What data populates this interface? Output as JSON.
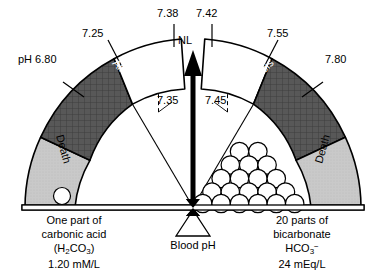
{
  "diagram": {
    "gauge": {
      "pointer_label": "NL",
      "segments": [
        {
          "name": "death-left",
          "label": "Death",
          "fill": "#c9c9c9",
          "from_ph": "6.80",
          "to_ph": "7.25"
        },
        {
          "name": "alkalosis-left",
          "label": "Alkalosis",
          "fill": "#5a5a5a",
          "from_ph": "7.25",
          "to_ph": "7.38"
        },
        {
          "name": "normal-left",
          "label": "",
          "fill": "#ffffff",
          "from_ph": "7.35",
          "to_ph": "7.38"
        },
        {
          "name": "normal-right",
          "label": "",
          "fill": "#ffffff",
          "from_ph": "7.42",
          "to_ph": "7.45"
        },
        {
          "name": "alkalosis-right",
          "label": "Alkalosis",
          "fill": "#5a5a5a",
          "from_ph": "7.42",
          "to_ph": "7.55"
        },
        {
          "name": "death-right",
          "label": "Death",
          "fill": "#c9c9c9",
          "from_ph": "7.55",
          "to_ph": "7.80"
        }
      ],
      "ticks": [
        {
          "name": "ph-6-80",
          "text": "pH 6.80",
          "solid": true
        },
        {
          "name": "ph-7-25",
          "text": "7.25",
          "solid": true
        },
        {
          "name": "ph-7-38",
          "text": "7.38",
          "solid": true
        },
        {
          "name": "ph-7-35",
          "text": "7.35",
          "solid": false
        },
        {
          "name": "ph-7-42",
          "text": "7.42",
          "solid": true
        },
        {
          "name": "ph-7-45",
          "text": "7.45",
          "solid": false
        },
        {
          "name": "ph-7-55",
          "text": "7.55",
          "solid": true
        },
        {
          "name": "ph-7-80",
          "text": "7.80",
          "solid": true
        }
      ]
    },
    "balance": {
      "fulcrum_label": "Blood pH",
      "left_pan": {
        "weight_count": 1,
        "lines": [
          "One part of",
          "carbonic acid",
          "(H2CO3)",
          "1.20 mM/L"
        ],
        "line1": "One part of",
        "line2": "carbonic acid",
        "formula_pre": "(H",
        "formula_sub1": "2",
        "formula_mid": "CO",
        "formula_sub2": "3",
        "formula_post": ")",
        "line4": "1.20 mM/L"
      },
      "right_pan": {
        "weight_count": 20,
        "rows": [
          2,
          3,
          4,
          5,
          6
        ],
        "line1": "20 parts of",
        "line2": "bicarbonate",
        "formula_pre": "HCO",
        "formula_sub": "3",
        "formula_sup": "−",
        "line4": "24 mEq/L"
      }
    },
    "colors": {
      "death": "#c9c9c9",
      "alkalosis": "#5a5a5a",
      "normal": "#ffffff",
      "stroke": "#000000"
    }
  }
}
